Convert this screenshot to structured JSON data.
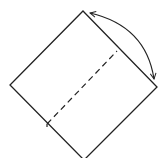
{
  "diagram": {
    "type": "origami-fold-instruction",
    "stroke_color": "#222222",
    "background": "#ffffff",
    "square": {
      "points": [
        [
          83,
          11
        ],
        [
          157,
          87
        ],
        [
          84,
          160
        ],
        [
          10,
          85
        ]
      ]
    },
    "fold_line": {
      "style": "dashed",
      "from": [
        47,
        124
      ],
      "to": [
        117,
        51
      ]
    },
    "arrow": {
      "type": "double-headed-arc",
      "from": [
        90,
        13
      ],
      "to": [
        154,
        80
      ]
    }
  }
}
